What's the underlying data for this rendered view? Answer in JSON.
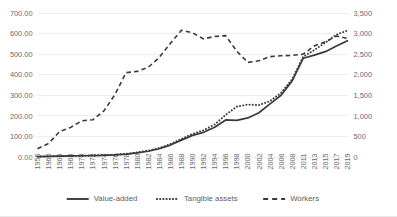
{
  "chart_data": {
    "type": "line",
    "title": "",
    "xlabel": "",
    "ylabel": "",
    "grid": true,
    "legend_position": "bottom",
    "categories": [
      "1955",
      "1960",
      "1966",
      "1968",
      "1970",
      "1972",
      "1974",
      "1976",
      "1978",
      "1980",
      "1982",
      "1984",
      "1986",
      "1988",
      "1990",
      "1992",
      "1994",
      "1996",
      "1998",
      "2000",
      "2002",
      "2004",
      "2006",
      "2008",
      "2011",
      "2013",
      "2015",
      "2017",
      "2019"
    ],
    "axes": {
      "left": {
        "ticks": [
          "0.00",
          "100.00",
          "200.00",
          "300.00",
          "400.00",
          "500.00",
          "600.00",
          "700.00"
        ],
        "min": 0,
        "max": 700,
        "step": 100
      },
      "right": {
        "ticks": [
          "0",
          "500",
          "1,000",
          "1,500",
          "2,000",
          "2,500",
          "3,000",
          "3,500"
        ],
        "min": 0,
        "max": 3500,
        "step": 500
      }
    },
    "series": [
      {
        "name": "Value-added",
        "axis": "left",
        "style": "solid",
        "color": "#3a3a3a",
        "values": [
          2,
          3,
          4,
          5,
          6,
          7,
          8,
          10,
          14,
          20,
          28,
          40,
          58,
          82,
          105,
          120,
          145,
          180,
          178,
          190,
          215,
          258,
          300,
          370,
          480,
          495,
          512,
          540,
          565
        ]
      },
      {
        "name": "Tangible assets",
        "axis": "left",
        "style": "dotted",
        "color": "#3a3a3a",
        "values": [
          2,
          3,
          4,
          5,
          6,
          8,
          9,
          11,
          15,
          22,
          31,
          44,
          63,
          88,
          112,
          130,
          158,
          205,
          245,
          255,
          252,
          272,
          312,
          378,
          488,
          520,
          556,
          595,
          615
        ]
      },
      {
        "name": "Workers",
        "axis": "right",
        "style": "dashed",
        "color": "#3a3a3a",
        "values": [
          200,
          330,
          620,
          720,
          880,
          905,
          1120,
          1520,
          2050,
          2080,
          2180,
          2420,
          2760,
          3080,
          3020,
          2870,
          2930,
          2950,
          2570,
          2300,
          2340,
          2440,
          2460,
          2470,
          2500,
          2700,
          2800,
          2940,
          2880
        ]
      }
    ]
  },
  "legend": {
    "items": [
      {
        "label": "Value-added"
      },
      {
        "label": "Tangible assets"
      },
      {
        "label": "Workers"
      }
    ]
  }
}
